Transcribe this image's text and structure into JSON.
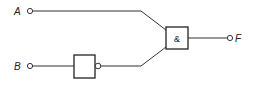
{
  "diagram": {
    "type": "logic-circuit",
    "inputs": [
      {
        "id": "A",
        "label": "A"
      },
      {
        "id": "B",
        "label": "B"
      }
    ],
    "output": {
      "id": "F",
      "label": "F"
    },
    "gates": [
      {
        "id": "not1",
        "type": "NOT",
        "label": "",
        "input": "B"
      },
      {
        "id": "and1",
        "type": "AND",
        "label": "&",
        "inputs": [
          "A",
          "not1"
        ]
      }
    ],
    "connections": [
      {
        "from": "A",
        "to": "and1"
      },
      {
        "from": "B",
        "to": "not1"
      },
      {
        "from": "not1",
        "to": "and1"
      },
      {
        "from": "and1",
        "to": "F"
      }
    ]
  }
}
